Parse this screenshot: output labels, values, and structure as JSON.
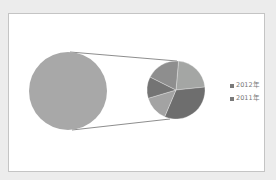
{
  "chart_data": {
    "type": "pie",
    "subtype": "pie-of-pie",
    "title": "",
    "main_pie": {
      "slices": [
        {
          "label": "Other",
          "value": 100,
          "color": "#a8a8a8"
        }
      ]
    },
    "secondary_pie": {
      "slices": [
        {
          "label": "slice-1",
          "value": 22,
          "color": "#a4a6a4"
        },
        {
          "label": "slice-2",
          "value": 33,
          "color": "#6e6e6e"
        },
        {
          "label": "slice-3",
          "value": 14,
          "color": "#a3a3a3"
        },
        {
          "label": "slice-4",
          "value": 12,
          "color": "#747474"
        },
        {
          "label": "slice-5",
          "value": 19,
          "color": "#8e8e8e"
        }
      ]
    },
    "legend": {
      "position": "right",
      "entries": [
        {
          "label": "2012年",
          "color": "#7a7a7a"
        },
        {
          "label": "2011年",
          "color": "#7a7a7a"
        }
      ]
    }
  },
  "legend": {
    "items": [
      {
        "label": "2012年"
      },
      {
        "label": "2011年"
      }
    ]
  }
}
